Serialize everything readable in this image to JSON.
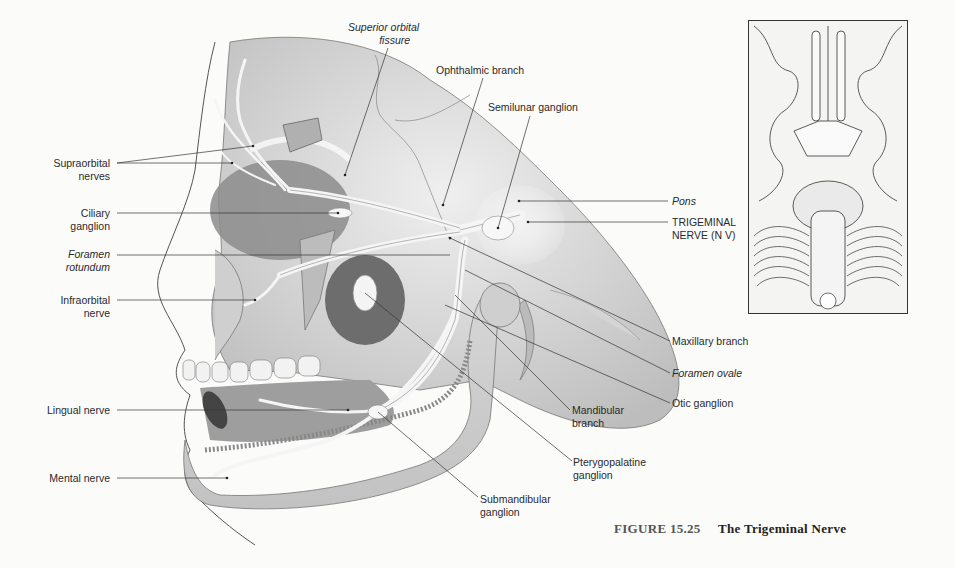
{
  "figure": {
    "number": "FIGURE 15.25",
    "title": "The Trigeminal Nerve"
  },
  "labels": {
    "superior_orbital_fissure": [
      "Superior orbital",
      "fissure"
    ],
    "ophthalmic_branch": [
      "Ophthalmic branch"
    ],
    "semilunar_ganglion": [
      "Semilunar ganglion"
    ],
    "supraorbital_nerves": [
      "Supraorbital",
      "nerves"
    ],
    "ciliary_ganglion": [
      "Ciliary",
      "ganglion"
    ],
    "foramen_rotundum": [
      "Foramen",
      "rotundum"
    ],
    "infraorbital_nerve": [
      "Infraorbital",
      "nerve"
    ],
    "lingual_nerve": [
      "Lingual nerve"
    ],
    "mental_nerve": [
      "Mental nerve"
    ],
    "pons": [
      "Pons"
    ],
    "trigeminal_nerve": [
      "TRIGEMINAL",
      "NERVE (N V)"
    ],
    "maxillary_branch": [
      "Maxillary branch"
    ],
    "foramen_ovale": [
      "Foramen ovale"
    ],
    "otic_ganglion": [
      "Otic ganglion"
    ],
    "mandibular_branch": [
      "Mandibular",
      "branch"
    ],
    "pterygopalatine_ganglion": [
      "Pterygopalatine",
      "ganglion"
    ],
    "submandibular_ganglion": [
      "Submandibular",
      "ganglion"
    ]
  },
  "inset": {
    "description": "inferior view of brain and brainstem"
  },
  "colors": {
    "background": "#fbfbfa",
    "text": "#2a2a2a",
    "bone": "#dcdcdc",
    "nerve": "#f4f4f4",
    "shadow": "#9a9a9a"
  }
}
